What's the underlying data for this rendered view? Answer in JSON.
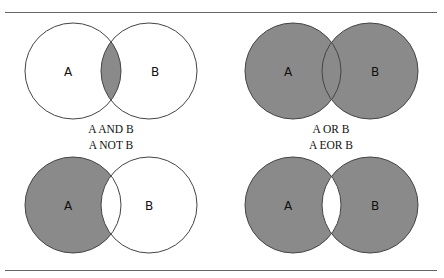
{
  "figure": {
    "colors": {
      "fill": "#8a8a8a",
      "stroke": "#444444",
      "background": "#ffffff"
    },
    "panels": [
      {
        "id": "and",
        "caption": "A AND B",
        "label_a": "A",
        "label_b": "B",
        "shade": "intersection"
      },
      {
        "id": "or",
        "caption": "A OR B",
        "label_a": "A",
        "label_b": "B",
        "shade": "union"
      },
      {
        "id": "not",
        "caption": "A NOT B",
        "label_a": "A",
        "label_b": "B",
        "shade": "a-minus-b"
      },
      {
        "id": "eor",
        "caption": "A EOR B",
        "label_a": "A",
        "label_b": "B",
        "shade": "symmetric-difference"
      }
    ]
  }
}
